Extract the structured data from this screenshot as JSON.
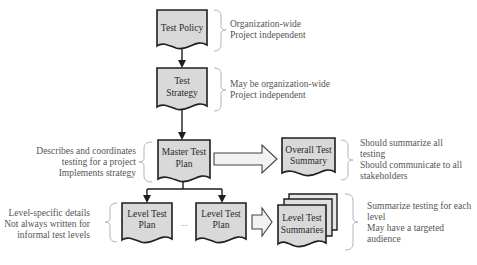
{
  "diagram": {
    "colors": {
      "node_fill": "#d9d9d9",
      "node_stroke": "#1e1e1e",
      "arrow_stroke": "#1e1e1e",
      "hollow_arrow_fill": "#f2f2f2",
      "hollow_arrow_stroke": "#444444",
      "brace_stroke": "#b5b5b5",
      "note_text": "#555555"
    },
    "nodes": {
      "test_policy": {
        "line1": "Test Policy",
        "line2": ""
      },
      "test_strategy": {
        "line1": "Test",
        "line2": "Strategy"
      },
      "master_test_plan": {
        "line1": "Master Test",
        "line2": "Plan"
      },
      "overall_test_summary": {
        "line1": "Overall Test",
        "line2": "Summary"
      },
      "level_test_plan_1": {
        "line1": "Level Test",
        "line2": "Plan"
      },
      "level_test_plan_2": {
        "line1": "Level Test",
        "line2": "Plan"
      },
      "level_test_summaries": {
        "line1": "Level Test",
        "line2": "Summaries"
      },
      "ellipsis": "..."
    },
    "notes": {
      "test_policy": [
        "Organization-wide",
        "Project independent"
      ],
      "test_strategy": [
        "May be organization-wide",
        "Project independent"
      ],
      "master_test_plan": [
        "Describes and coordinates",
        "testing for a project",
        "Implements strategy"
      ],
      "overall_test_summary": [
        "Should summarize all",
        "testing",
        "Should communicate to all",
        "stakeholders"
      ],
      "level_test_plan": [
        "Level-specific details",
        "Not always written for",
        "informal test levels"
      ],
      "level_test_summaries": [
        "Summarize testing for each",
        "level",
        "May have a targeted",
        "audience"
      ]
    }
  }
}
